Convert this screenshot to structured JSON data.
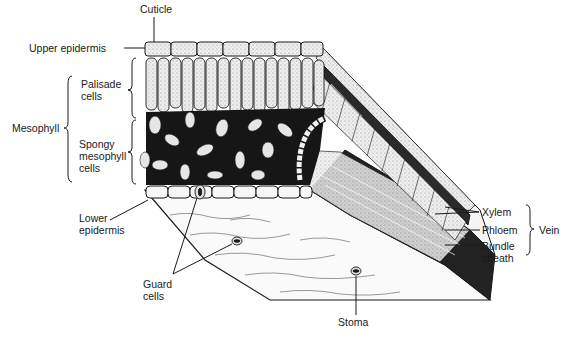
{
  "diagram": {
    "labels": {
      "cuticle": "Cuticle",
      "upper_epidermis": "Upper epidermis",
      "mesophyll": "Mesophyll",
      "palisade_1": "Palisade",
      "palisade_2": "cells",
      "spongy_1": "Spongy",
      "spongy_2": "mesophyll",
      "spongy_3": "cells",
      "lower_epidermis_1": "Lower",
      "lower_epidermis_2": "epidermis",
      "guard_1": "Guard",
      "guard_2": "cells",
      "stoma": "Stoma",
      "xylem": "Xylem",
      "phloem": "Phloem",
      "bundle_1": "Bundle",
      "bundle_2": "sheath",
      "vein": "Vein"
    },
    "colors": {
      "ink": "#1a1a1a",
      "background": "#ffffff",
      "cell_fill": "#e8e8e8"
    }
  }
}
